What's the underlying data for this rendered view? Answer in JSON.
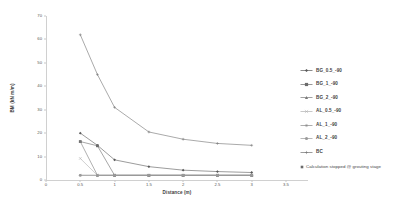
{
  "chart_data": {
    "type": "line",
    "title": "",
    "xlabel": "Distance (m)",
    "ylabel": "BM (kN m/m)",
    "xlim": [
      0,
      3.5
    ],
    "ylim": [
      0,
      70
    ],
    "xticks": [
      "0",
      "0.5",
      "1",
      "1.5",
      "2",
      "2.5",
      "3",
      "3.5"
    ],
    "xtick_values": [
      0,
      0.5,
      1,
      1.5,
      2,
      2.5,
      3,
      3.5
    ],
    "yticks": [
      "0",
      "10",
      "20",
      "30",
      "40",
      "50",
      "60",
      "70"
    ],
    "ytick_values": [
      0,
      10,
      20,
      30,
      40,
      50,
      60,
      70
    ],
    "grid": false,
    "legend_position": "right",
    "series": [
      {
        "name": "BG_0.5_-90",
        "marker": "diamond",
        "color": "#595959",
        "x": [
          0.5,
          0.75,
          1,
          1.5,
          2,
          2.5,
          3
        ],
        "values": [
          20.0,
          14.8,
          8.6,
          5.7,
          4.2,
          3.6,
          3.2
        ]
      },
      {
        "name": "BG_1_-90",
        "marker": "square",
        "color": "#6b6b6b",
        "x": [
          0.5,
          0.75,
          1,
          1.5,
          2,
          2.5,
          3
        ],
        "values": [
          16.4,
          14.6,
          2.0,
          2.0,
          2.0,
          2.0,
          2.0
        ]
      },
      {
        "name": "BG_2_-90",
        "marker": "triangle",
        "color": "#7a7a7a",
        "x": [
          0.5,
          0.75,
          1,
          1.5,
          2,
          2.5,
          3
        ],
        "values": [
          16.4,
          2.0,
          2.0,
          2.0,
          2.0,
          2.0,
          2.0
        ]
      },
      {
        "name": "AL_0.5_-90",
        "marker": "cross",
        "color": "#b0b0b0",
        "x": [
          0.5,
          0.75,
          1,
          1.5,
          2,
          2.5,
          3
        ],
        "values": [
          9.2,
          2.0,
          2.0,
          2.0,
          2.0,
          2.0,
          2.0
        ]
      },
      {
        "name": "AL_1_-90",
        "marker": "star",
        "color": "#8a8a8a",
        "x": [
          0.5,
          0.75,
          1,
          1.5,
          2,
          2.5,
          3
        ],
        "values": [
          2.0,
          2.0,
          2.0,
          2.0,
          2.0,
          2.0,
          2.0
        ]
      },
      {
        "name": "AL_2_-90",
        "marker": "circle",
        "color": "#9a9a9a",
        "x": [
          0.5,
          0.75,
          1,
          1.5,
          2,
          2.5,
          3
        ],
        "values": [
          2.0,
          2.0,
          2.0,
          2.0,
          2.0,
          2.0,
          2.0
        ]
      },
      {
        "name": "BC",
        "marker": "plus",
        "color": "#707070",
        "x": [
          0.5,
          0.75,
          1,
          1.5,
          2,
          2.5,
          3
        ],
        "values": [
          62.0,
          45.0,
          31.0,
          20.5,
          17.4,
          15.6,
          14.8
        ]
      }
    ],
    "annotation": "Calculation stopped @ grouting stage"
  },
  "legend": {
    "items": [
      {
        "label": "BG_0.5_-90"
      },
      {
        "label": "BG_1_-90"
      },
      {
        "label": "BG_2_-90"
      },
      {
        "label": "AL_0.5_-90"
      },
      {
        "label": "AL_1_-90"
      },
      {
        "label": "AL_2_-90"
      },
      {
        "label": "BC"
      }
    ],
    "note": "Calculation stopped @ grouting stage"
  }
}
